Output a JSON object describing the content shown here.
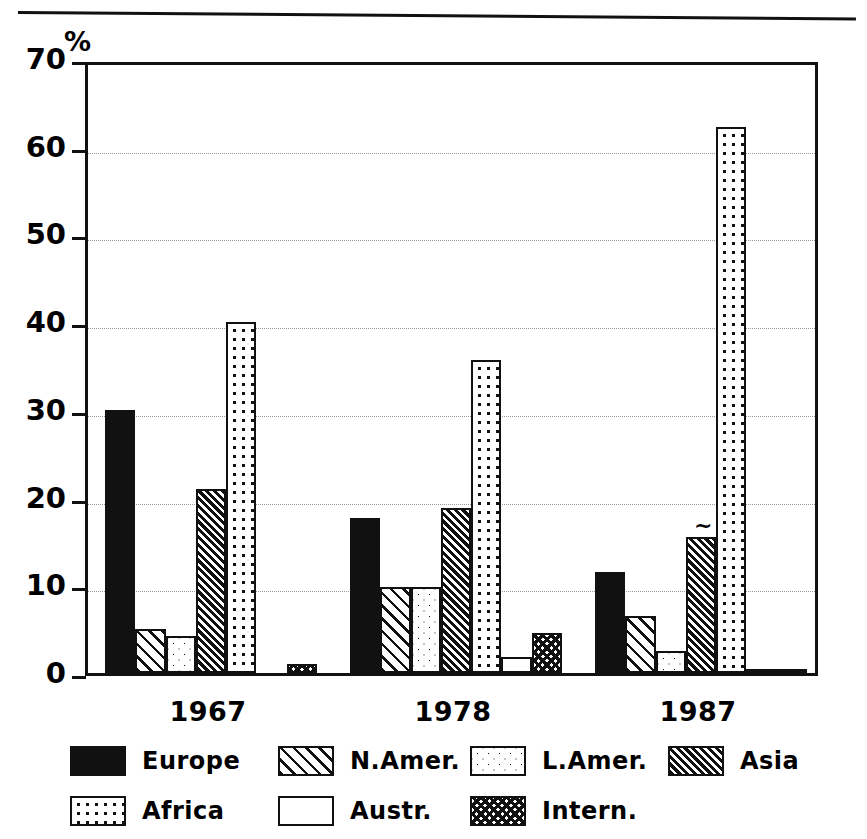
{
  "chart_data": {
    "type": "bar",
    "title": "",
    "subtitle": "",
    "xlabel": "",
    "ylabel": "%",
    "unit_label": "%",
    "categories": [
      "1967",
      "1978",
      "1987"
    ],
    "ylim": [
      0,
      70
    ],
    "yticks": [
      0,
      10,
      20,
      30,
      40,
      50,
      60,
      70
    ],
    "ytick_labels": [
      "0",
      "10",
      "20",
      "30",
      "40",
      "50",
      "60",
      "70"
    ],
    "grid": "horizontal-dotted",
    "legend_position": "bottom",
    "annotations": [
      {
        "text": "~",
        "near_series": "Asia",
        "near_category": "1987"
      }
    ],
    "series": [
      {
        "name": "Europe",
        "pattern": "solid-black",
        "values": [
          30.0,
          17.7,
          11.5
        ]
      },
      {
        "name": "N.Amer.",
        "pattern": "sparse-hatch",
        "values": [
          5.0,
          9.8,
          6.5
        ]
      },
      {
        "name": "L.Amer.",
        "pattern": "light-stipple",
        "values": [
          4.2,
          9.8,
          2.5
        ]
      },
      {
        "name": "Asia",
        "pattern": "dense-hatch",
        "values": [
          21.0,
          18.8,
          15.5
        ]
      },
      {
        "name": "Africa",
        "pattern": "dot-grid",
        "values": [
          40.0,
          35.7,
          62.3
        ]
      },
      {
        "name": "Austr.",
        "pattern": "empty-white",
        "values": [
          0.0,
          1.8,
          0.4
        ]
      },
      {
        "name": "Intern.",
        "pattern": "crosshatch",
        "values": [
          1.0,
          4.6,
          0.5
        ]
      }
    ]
  },
  "legend": {
    "entries": [
      {
        "label": "Europe"
      },
      {
        "label": "N.Amer."
      },
      {
        "label": "L.Amer."
      },
      {
        "label": "Asia"
      },
      {
        "label": "Africa"
      },
      {
        "label": "Austr."
      },
      {
        "label": "Intern."
      }
    ]
  }
}
